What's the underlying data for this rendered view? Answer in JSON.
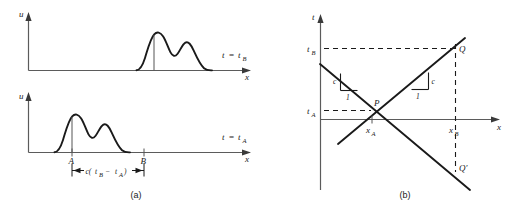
{
  "figure": {
    "panels": [
      {
        "id": "a",
        "caption": "(a)",
        "subplots": [
          {
            "id": "top",
            "y_axis_label": "u",
            "x_axis_label": "x",
            "time_label": {
              "var": "t",
              "eq": "=",
              "value": "t",
              "value_sub": "B"
            },
            "pulse_note": "wave packet shifted right"
          },
          {
            "id": "bottom",
            "y_axis_label": "u",
            "x_axis_label": "x",
            "time_label": {
              "var": "t",
              "eq": "=",
              "value": "t",
              "value_sub": "A"
            },
            "point_labels": [
              "A",
              "B"
            ],
            "dimension": {
              "prefix": "c(",
              "term1": "t",
              "term1_sub": "B",
              "minus": "−",
              "term2": "t",
              "term2_sub": "A",
              "suffix": ")"
            }
          }
        ]
      },
      {
        "id": "b",
        "caption": "(b)",
        "y_axis_label": "t",
        "x_axis_label": "x",
        "tick_labels": {
          "t_B": {
            "base": "t",
            "sub": "B"
          },
          "t_A": {
            "base": "t",
            "sub": "A"
          },
          "x_A": {
            "base": "x",
            "sub": "A"
          },
          "x_B": {
            "base": "x",
            "sub": "B"
          }
        },
        "point_labels": {
          "P": "P",
          "Q": "Q",
          "Q_prime": "Q′"
        },
        "slope_triangles": [
          {
            "id": "left",
            "vertical_leg": "c",
            "horizontal_leg": "1"
          },
          {
            "id": "right",
            "vertical_leg": "c",
            "horizontal_leg": "1"
          }
        ]
      }
    ]
  },
  "colors": {
    "ink": "#1a1a1a",
    "axis": "#5b5b5b",
    "background": "#ffffff"
  }
}
